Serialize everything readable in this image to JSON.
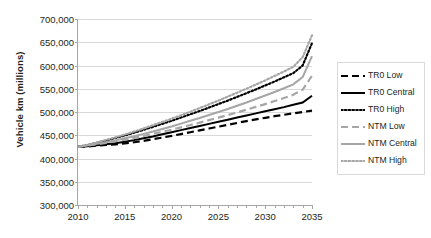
{
  "chart_data": {
    "type": "line",
    "title": "",
    "xlabel": "",
    "ylabel": "Vehicle km (millions)",
    "xlim": [
      2010,
      2035
    ],
    "ylim": [
      300000,
      700000
    ],
    "ytick_step": 50000,
    "ytick_labels": [
      "700,000",
      "650,000",
      "600,000",
      "550,000",
      "500,000",
      "450,000",
      "400,000",
      "350,000",
      "300,000"
    ],
    "ytick_values": [
      700000,
      650000,
      600000,
      550000,
      500000,
      450000,
      400000,
      350000,
      300000
    ],
    "xtick_labels": [
      "2010",
      "2015",
      "2020",
      "2025",
      "2030",
      "2035"
    ],
    "xtick_values": [
      2010,
      2015,
      2020,
      2025,
      2030,
      2035
    ],
    "x_minor_tick_interval": 1,
    "grid": "horizontal",
    "legend_position": "right",
    "x": [
      2010,
      2011,
      2012,
      2013,
      2014,
      2015,
      2016,
      2017,
      2018,
      2019,
      2020,
      2021,
      2022,
      2023,
      2024,
      2025,
      2026,
      2027,
      2028,
      2029,
      2030,
      2031,
      2032,
      2033,
      2034,
      2035
    ],
    "series": [
      {
        "name": "TR0 Low",
        "style": "dashed",
        "color": "#000000",
        "values": [
          425000,
          426000,
          427500,
          429000,
          430500,
          432500,
          435000,
          438000,
          441500,
          445000,
          448500,
          452500,
          456500,
          460500,
          464500,
          468500,
          472500,
          476500,
          480500,
          484000,
          487500,
          491000,
          494000,
          497000,
          500000,
          503000
        ]
      },
      {
        "name": "TR0 Central",
        "style": "solid",
        "color": "#000000",
        "values": [
          425000,
          426500,
          428500,
          430500,
          433000,
          436000,
          439500,
          443500,
          447500,
          452000,
          456500,
          461000,
          465500,
          470000,
          474500,
          479000,
          483500,
          488000,
          492500,
          497000,
          501500,
          506000,
          510500,
          515500,
          520500,
          535000
        ]
      },
      {
        "name": "TR0 High",
        "style": "dotted",
        "color": "#000000",
        "values": [
          425000,
          429000,
          433500,
          438500,
          444000,
          449500,
          455500,
          461500,
          468000,
          474500,
          481000,
          488000,
          495000,
          502000,
          509500,
          517000,
          524500,
          532500,
          540500,
          548500,
          557000,
          565500,
          574500,
          583500,
          600000,
          648000
        ]
      },
      {
        "name": "NTM Low",
        "style": "dashed",
        "color": "#a6a6a6",
        "values": [
          425000,
          427500,
          430500,
          433500,
          437000,
          440500,
          444500,
          448500,
          453000,
          457500,
          462000,
          467000,
          472000,
          477000,
          482500,
          488000,
          493500,
          499000,
          505000,
          511000,
          517000,
          523500,
          530000,
          537000,
          548000,
          578000
        ]
      },
      {
        "name": "NTM Central",
        "style": "solid",
        "color": "#a6a6a6",
        "values": [
          425000,
          428000,
          431500,
          435000,
          439000,
          443500,
          448000,
          453000,
          458000,
          463500,
          469000,
          475000,
          481000,
          487000,
          493500,
          500000,
          506500,
          513500,
          520500,
          528000,
          535500,
          543000,
          551000,
          559500,
          575000,
          620000
        ]
      },
      {
        "name": "NTM High",
        "style": "dotted",
        "color": "#a6a6a6",
        "values": [
          425000,
          429500,
          434500,
          440000,
          445500,
          451500,
          458000,
          464500,
          471500,
          478500,
          485500,
          493000,
          500500,
          508500,
          516500,
          524500,
          533000,
          541500,
          550000,
          559000,
          568000,
          577500,
          587000,
          597000,
          618000,
          665000
        ]
      }
    ]
  },
  "legend": {
    "items": [
      {
        "label": "TR0 Low"
      },
      {
        "label": "TR0 Central"
      },
      {
        "label": "TR0 High"
      },
      {
        "label": "NTM Low"
      },
      {
        "label": "NTM Central"
      },
      {
        "label": "NTM High"
      }
    ]
  }
}
